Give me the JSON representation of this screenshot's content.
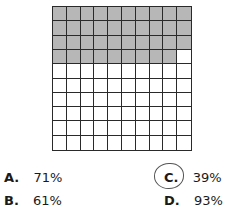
{
  "grid": {
    "rows": 10,
    "cols": 10,
    "shaded_count": 39,
    "shaded_color": "#b7b7b7",
    "line_color": "#2a2a2a"
  },
  "options": [
    {
      "letter": "A.",
      "value": "71%"
    },
    {
      "letter": "B.",
      "value": "61%"
    },
    {
      "letter": "C.",
      "value": "39%",
      "circled": true
    },
    {
      "letter": "D.",
      "value": "93%"
    }
  ]
}
